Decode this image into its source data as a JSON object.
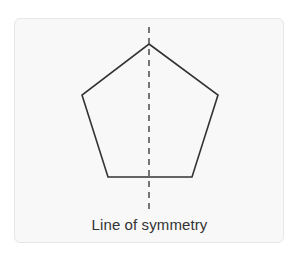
{
  "diagram": {
    "shape": "regular pentagon",
    "label": "Line of symmetry",
    "colors": {
      "card_background": "#f8f8f8",
      "card_border": "#e6e6e6",
      "stroke": "#333333",
      "axis": "#555555",
      "text": "#333333"
    },
    "pentagon_points": "149,44 218,95 192,177 108,177 82,95",
    "symmetry_axis": {
      "x": 149,
      "y1": 27,
      "y2": 213,
      "dasharray": "6,5"
    }
  }
}
